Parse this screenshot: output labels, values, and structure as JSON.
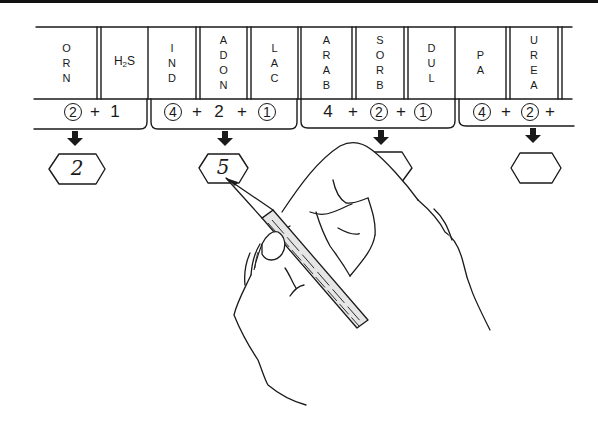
{
  "tests": [
    {
      "id": "orn",
      "label": "ORN",
      "letters": [
        "O",
        "R",
        "N"
      ]
    },
    {
      "id": "h2s",
      "label": "H2S",
      "letters": [
        "H2S"
      ]
    },
    {
      "id": "ind",
      "label": "IND",
      "letters": [
        "I",
        "N",
        "D"
      ]
    },
    {
      "id": "adon",
      "label": "ADON",
      "letters": [
        "A",
        "D",
        "O",
        "N"
      ]
    },
    {
      "id": "lac",
      "label": "LAC",
      "letters": [
        "L",
        "A",
        "C"
      ]
    },
    {
      "id": "arab",
      "label": "ARAB",
      "letters": [
        "A",
        "R",
        "A",
        "B"
      ]
    },
    {
      "id": "sorb",
      "label": "SORB",
      "letters": [
        "S",
        "O",
        "R",
        "B"
      ]
    },
    {
      "id": "dul",
      "label": "DUL",
      "letters": [
        "D",
        "U",
        "L"
      ]
    },
    {
      "id": "pa",
      "label": "PA",
      "letters": [
        "P",
        "A"
      ]
    },
    {
      "id": "urea",
      "label": "UREA",
      "letters": [
        "U",
        "R",
        "E",
        "A"
      ]
    }
  ],
  "h2s": {
    "main": "H",
    "sub": "2",
    "tail": "S"
  },
  "groups": [
    {
      "id": "group-1",
      "terms": [
        {
          "value": "2",
          "circled": true
        },
        {
          "value": "+",
          "op": true
        },
        {
          "value": "1",
          "circled": false
        }
      ],
      "result": "2"
    },
    {
      "id": "group-2",
      "terms": [
        {
          "value": "4",
          "circled": true
        },
        {
          "value": "+",
          "op": true
        },
        {
          "value": "2",
          "circled": false
        },
        {
          "value": "+",
          "op": true
        },
        {
          "value": "1",
          "circled": true
        }
      ],
      "result": "5"
    },
    {
      "id": "group-3",
      "terms": [
        {
          "value": "4",
          "circled": false
        },
        {
          "value": "+",
          "op": true
        },
        {
          "value": "2",
          "circled": true
        },
        {
          "value": "+",
          "op": true
        },
        {
          "value": "1",
          "circled": true
        }
      ],
      "result": ""
    },
    {
      "id": "group-4",
      "terms": [
        {
          "value": "4",
          "circled": true
        },
        {
          "value": "+",
          "op": true
        },
        {
          "value": "2",
          "circled": true
        },
        {
          "value": "+",
          "op": true
        }
      ],
      "result": ""
    }
  ],
  "colors": {
    "ink": "#1a1a1a",
    "paper": "#ffffff",
    "pencil_fill": "#e6e6e6"
  }
}
